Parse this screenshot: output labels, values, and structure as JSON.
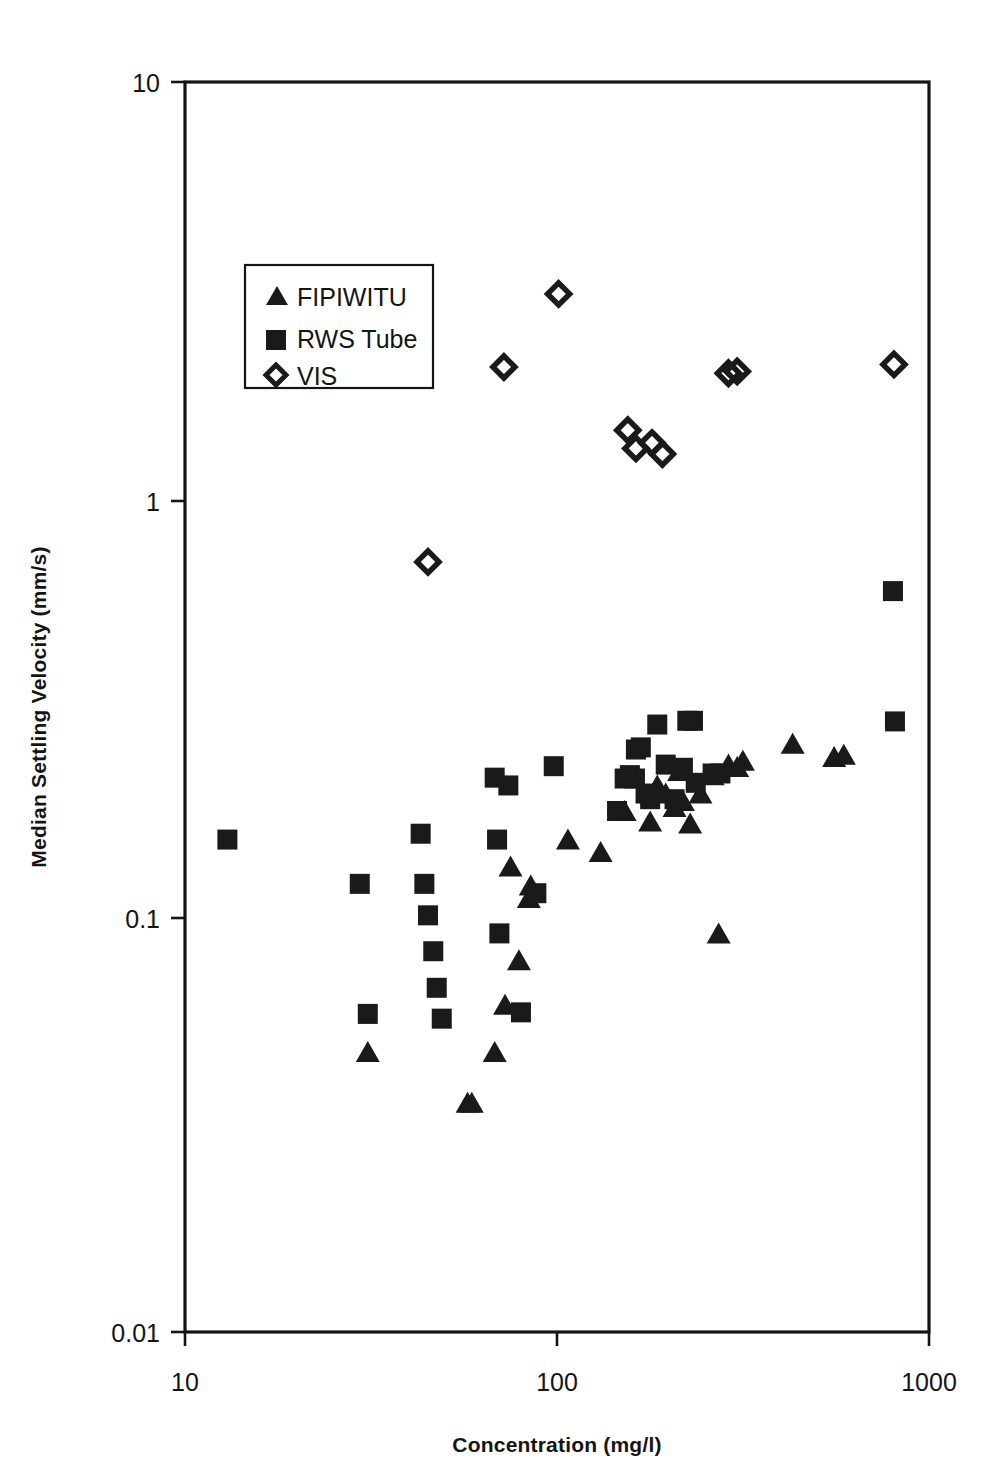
{
  "chart_data": {
    "type": "scatter",
    "title": "",
    "xlabel": "Concentration (mg/l)",
    "ylabel": "Median Settling Velocity (mm/s)",
    "xscale": "log",
    "yscale": "log",
    "xlim": [
      10,
      1000
    ],
    "ylim": [
      0.01,
      10
    ],
    "xticks": [
      10,
      100,
      1000
    ],
    "xtick_labels": [
      "10",
      "100",
      "1000"
    ],
    "yticks": [
      0.01,
      0.1,
      1,
      10
    ],
    "ytick_labels": [
      "0.01",
      "0.1",
      "1",
      "10"
    ],
    "grid": false,
    "legend_position": "upper-left-inside",
    "series": [
      {
        "name": "FIPIWITU",
        "marker": "triangle",
        "color": "#1a1a1a",
        "points": [
          [
            31.0,
            0.047
          ],
          [
            57.5,
            0.0355
          ],
          [
            59.0,
            0.0355
          ],
          [
            68.0,
            0.047
          ],
          [
            72.5,
            0.061
          ],
          [
            79.0,
            0.078
          ],
          [
            84.0,
            0.11
          ],
          [
            85.0,
            0.118
          ],
          [
            75.0,
            0.131
          ],
          [
            107.0,
            0.152
          ],
          [
            131.0,
            0.142
          ],
          [
            152.0,
            0.178
          ],
          [
            178.0,
            0.168
          ],
          [
            186.0,
            0.205
          ],
          [
            196.0,
            0.196
          ],
          [
            207.0,
            0.182
          ],
          [
            213.0,
            0.222
          ],
          [
            218.0,
            0.188
          ],
          [
            228.0,
            0.166
          ],
          [
            243.0,
            0.196
          ],
          [
            262.0,
            0.217
          ],
          [
            272.0,
            0.0905
          ],
          [
            289.0,
            0.23
          ],
          [
            305.0,
            0.227
          ],
          [
            316.0,
            0.235
          ],
          [
            430.0,
            0.258
          ],
          [
            556.0,
            0.24
          ],
          [
            590.0,
            0.243
          ]
        ]
      },
      {
        "name": "RWS Tube",
        "marker": "square",
        "color": "#1a1a1a",
        "points": [
          [
            13.0,
            0.152
          ],
          [
            29.5,
            0.119
          ],
          [
            31.0,
            0.058
          ],
          [
            43.0,
            0.157
          ],
          [
            44.0,
            0.119
          ],
          [
            45.0,
            0.1
          ],
          [
            46.5,
            0.082
          ],
          [
            47.5,
            0.067
          ],
          [
            49.0,
            0.0565
          ],
          [
            68.0,
            0.214
          ],
          [
            69.0,
            0.152
          ],
          [
            70.0,
            0.0905
          ],
          [
            74.0,
            0.205
          ],
          [
            80.0,
            0.0585
          ],
          [
            88.0,
            0.113
          ],
          [
            98.0,
            0.228
          ],
          [
            145.0,
            0.178
          ],
          [
            152.0,
            0.213
          ],
          [
            157.0,
            0.217
          ],
          [
            162.0,
            0.213
          ],
          [
            163.0,
            0.25
          ],
          [
            168.0,
            0.253
          ],
          [
            173.0,
            0.196
          ],
          [
            178.0,
            0.19
          ],
          [
            186.0,
            0.287
          ],
          [
            196.0,
            0.23
          ],
          [
            207.0,
            0.19
          ],
          [
            218.0,
            0.226
          ],
          [
            224.0,
            0.293
          ],
          [
            232.0,
            0.293
          ],
          [
            236.0,
            0.208
          ],
          [
            262.0,
            0.219
          ],
          [
            275.0,
            0.219
          ],
          [
            800.0,
            0.6
          ],
          [
            810.0,
            0.292
          ]
        ]
      },
      {
        "name": "VIS",
        "marker": "diamond",
        "color": "#1a1a1a",
        "points": [
          [
            45.0,
            0.705
          ],
          [
            72.0,
            2.07
          ],
          [
            101.0,
            3.1
          ],
          [
            155.0,
            1.46
          ],
          [
            163.0,
            1.32
          ],
          [
            180.0,
            1.36
          ],
          [
            192.0,
            1.28
          ],
          [
            289.0,
            2.0
          ],
          [
            305.0,
            2.02
          ],
          [
            805.0,
            2.1
          ]
        ]
      }
    ]
  },
  "legend": {
    "entries": [
      {
        "label": "FIPIWITU",
        "marker": "triangle"
      },
      {
        "label": "RWS Tube",
        "marker": "square"
      },
      {
        "label": "VIS",
        "marker": "diamond"
      }
    ]
  },
  "colors": {
    "ink": "#1a1a1a",
    "background": "#ffffff",
    "axis": "#141414"
  }
}
